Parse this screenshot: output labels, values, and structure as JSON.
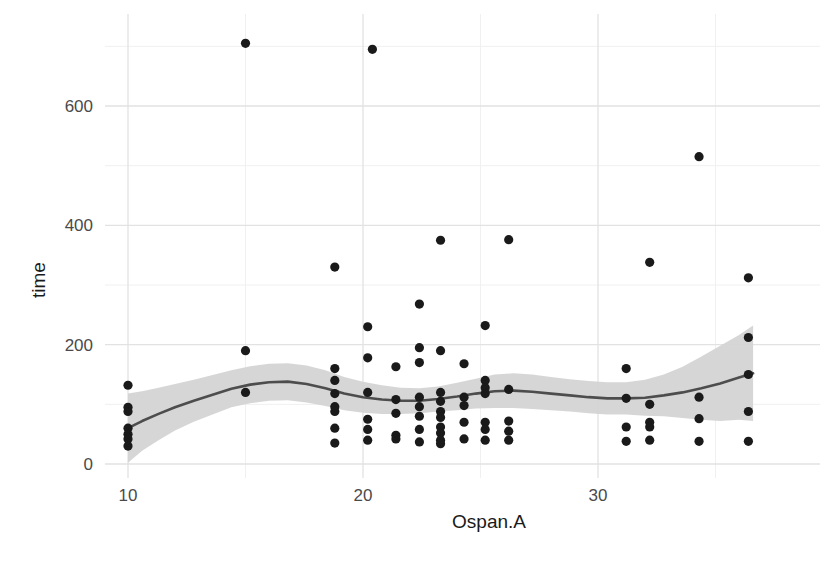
{
  "chart_data": {
    "type": "scatter",
    "title": "",
    "subtitle": "",
    "xlabel": "Ospan.A",
    "ylabel": "time",
    "xlim": [
      9.0,
      37.2
    ],
    "ylim": [
      -25,
      730
    ],
    "x_ticks": [
      10,
      20,
      30
    ],
    "x_tick_labels": [
      "10",
      "20",
      "30"
    ],
    "y_ticks": [
      0,
      200,
      400,
      600
    ],
    "y_tick_labels": [
      "0",
      "200",
      "400",
      "600"
    ],
    "x_minor_ticks": [
      15,
      25,
      35
    ],
    "y_minor_ticks": [
      100,
      300,
      500,
      700
    ],
    "grid": true,
    "legend": "none",
    "panel_background": "#ffffff",
    "grid_major_color": "#e2e2e2",
    "grid_minor_color": "#f0f0f0",
    "point_color": "#1a1a1a",
    "point_radius": 4.6,
    "smooth_line_color": "#4d4d4d",
    "smooth_line_width": 2.6,
    "ribbon_color": "#d4d4d4",
    "ribbon_opacity": 0.95,
    "points": [
      [
        10,
        132
      ],
      [
        10,
        95
      ],
      [
        10,
        88
      ],
      [
        10,
        60
      ],
      [
        10,
        50
      ],
      [
        10,
        42
      ],
      [
        10,
        30
      ],
      [
        15,
        705
      ],
      [
        15,
        190
      ],
      [
        15,
        120
      ],
      [
        18.8,
        330
      ],
      [
        18.8,
        160
      ],
      [
        18.8,
        140
      ],
      [
        18.8,
        118
      ],
      [
        18.8,
        96
      ],
      [
        18.8,
        88
      ],
      [
        18.8,
        60
      ],
      [
        18.8,
        35
      ],
      [
        20.4,
        695
      ],
      [
        20.2,
        230
      ],
      [
        20.2,
        178
      ],
      [
        20.2,
        120
      ],
      [
        20.2,
        75
      ],
      [
        20.2,
        58
      ],
      [
        20.2,
        40
      ],
      [
        21.4,
        163
      ],
      [
        21.4,
        108
      ],
      [
        21.4,
        85
      ],
      [
        21.4,
        48
      ],
      [
        21.4,
        42
      ],
      [
        22.4,
        268
      ],
      [
        22.4,
        195
      ],
      [
        22.4,
        170
      ],
      [
        22.4,
        112
      ],
      [
        22.4,
        96
      ],
      [
        22.4,
        80
      ],
      [
        22.4,
        58
      ],
      [
        22.4,
        37
      ],
      [
        23.3,
        375
      ],
      [
        23.3,
        190
      ],
      [
        23.3,
        120
      ],
      [
        23.3,
        105
      ],
      [
        23.3,
        88
      ],
      [
        23.3,
        78
      ],
      [
        23.3,
        62
      ],
      [
        23.3,
        52
      ],
      [
        23.3,
        40
      ],
      [
        23.3,
        34
      ],
      [
        24.3,
        168
      ],
      [
        24.3,
        112
      ],
      [
        24.3,
        98
      ],
      [
        24.3,
        70
      ],
      [
        24.3,
        42
      ],
      [
        25.2,
        232
      ],
      [
        25.2,
        140
      ],
      [
        25.2,
        128
      ],
      [
        25.2,
        118
      ],
      [
        25.2,
        70
      ],
      [
        25.2,
        58
      ],
      [
        25.2,
        40
      ],
      [
        26.2,
        376
      ],
      [
        26.2,
        125
      ],
      [
        26.2,
        72
      ],
      [
        26.2,
        55
      ],
      [
        26.2,
        40
      ],
      [
        31.2,
        160
      ],
      [
        31.2,
        110
      ],
      [
        31.2,
        62
      ],
      [
        31.2,
        38
      ],
      [
        32.2,
        338
      ],
      [
        32.2,
        100
      ],
      [
        32.2,
        70
      ],
      [
        32.2,
        62
      ],
      [
        32.2,
        40
      ],
      [
        34.3,
        515
      ],
      [
        34.3,
        112
      ],
      [
        34.3,
        76
      ],
      [
        34.3,
        38
      ],
      [
        36.4,
        312
      ],
      [
        36.4,
        212
      ],
      [
        36.4,
        150
      ],
      [
        36.4,
        88
      ],
      [
        36.4,
        38
      ]
    ],
    "smooth_curve": [
      [
        10.0,
        60
      ],
      [
        10.6,
        72
      ],
      [
        11.3,
        84
      ],
      [
        12.0,
        95
      ],
      [
        12.8,
        106
      ],
      [
        13.6,
        116
      ],
      [
        14.4,
        126
      ],
      [
        15.2,
        133
      ],
      [
        16.0,
        137
      ],
      [
        16.8,
        138
      ],
      [
        17.6,
        134
      ],
      [
        18.4,
        127
      ],
      [
        19.2,
        118
      ],
      [
        20.0,
        112
      ],
      [
        20.8,
        108
      ],
      [
        21.6,
        106
      ],
      [
        22.4,
        106
      ],
      [
        23.2,
        109
      ],
      [
        24.0,
        113
      ],
      [
        24.8,
        118
      ],
      [
        25.6,
        122
      ],
      [
        26.4,
        123
      ],
      [
        27.2,
        121
      ],
      [
        28.0,
        118
      ],
      [
        28.8,
        115
      ],
      [
        29.6,
        112
      ],
      [
        30.4,
        110
      ],
      [
        31.2,
        110
      ],
      [
        32.0,
        111
      ],
      [
        32.8,
        115
      ],
      [
        33.6,
        120
      ],
      [
        34.4,
        127
      ],
      [
        35.2,
        135
      ],
      [
        36.0,
        145
      ],
      [
        36.6,
        152
      ]
    ],
    "smooth_upper": [
      [
        10.0,
        118
      ],
      [
        10.6,
        122
      ],
      [
        11.3,
        128
      ],
      [
        12.0,
        134
      ],
      [
        12.8,
        141
      ],
      [
        13.6,
        149
      ],
      [
        14.4,
        157
      ],
      [
        15.2,
        164
      ],
      [
        16.0,
        168
      ],
      [
        16.8,
        169
      ],
      [
        17.6,
        165
      ],
      [
        18.4,
        157
      ],
      [
        19.2,
        146
      ],
      [
        20.0,
        138
      ],
      [
        20.8,
        132
      ],
      [
        21.6,
        128
      ],
      [
        22.4,
        127
      ],
      [
        23.2,
        130
      ],
      [
        24.0,
        136
      ],
      [
        24.8,
        143
      ],
      [
        25.6,
        150
      ],
      [
        26.4,
        152
      ],
      [
        27.2,
        150
      ],
      [
        28.0,
        146
      ],
      [
        28.8,
        142
      ],
      [
        29.6,
        139
      ],
      [
        30.4,
        137
      ],
      [
        31.2,
        137
      ],
      [
        32.0,
        141
      ],
      [
        32.8,
        150
      ],
      [
        33.6,
        163
      ],
      [
        34.4,
        180
      ],
      [
        35.2,
        198
      ],
      [
        36.0,
        216
      ],
      [
        36.6,
        232
      ]
    ],
    "smooth_lower": [
      [
        10.0,
        2
      ],
      [
        10.6,
        22
      ],
      [
        11.3,
        40
      ],
      [
        12.0,
        56
      ],
      [
        12.8,
        71
      ],
      [
        13.6,
        83
      ],
      [
        14.4,
        95
      ],
      [
        15.2,
        102
      ],
      [
        16.0,
        106
      ],
      [
        16.8,
        107
      ],
      [
        17.6,
        103
      ],
      [
        18.4,
        97
      ],
      [
        19.2,
        90
      ],
      [
        20.0,
        86
      ],
      [
        20.8,
        84
      ],
      [
        21.6,
        84
      ],
      [
        22.4,
        85
      ],
      [
        23.2,
        88
      ],
      [
        24.0,
        90
      ],
      [
        24.8,
        93
      ],
      [
        25.6,
        94
      ],
      [
        26.4,
        94
      ],
      [
        27.2,
        92
      ],
      [
        28.0,
        90
      ],
      [
        28.8,
        88
      ],
      [
        29.6,
        85
      ],
      [
        30.4,
        83
      ],
      [
        31.2,
        83
      ],
      [
        32.0,
        81
      ],
      [
        32.8,
        80
      ],
      [
        33.6,
        77
      ],
      [
        34.4,
        74
      ],
      [
        35.2,
        72
      ],
      [
        36.0,
        74
      ],
      [
        36.6,
        72
      ]
    ]
  },
  "axes": {
    "x_title": "Ospan.A",
    "y_title": "time",
    "x_labels": [
      "10",
      "20",
      "30"
    ],
    "y_labels": [
      "600",
      "400",
      "200",
      "0"
    ]
  }
}
